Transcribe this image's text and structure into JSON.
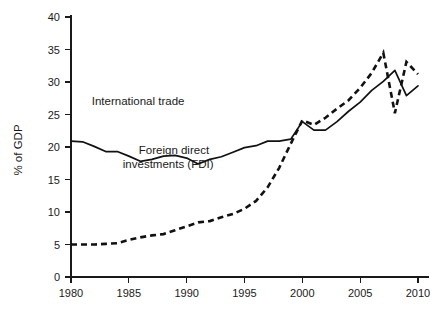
{
  "chart_data": {
    "type": "line",
    "title": "",
    "xlabel": "",
    "ylabel": "% of GDP",
    "xlim": [
      1980,
      2010
    ],
    "ylim": [
      0,
      40
    ],
    "grid": false,
    "legend_position": "inline-annotations",
    "x": [
      1980,
      1981,
      1982,
      1983,
      1984,
      1985,
      1986,
      1987,
      1988,
      1989,
      1990,
      1991,
      1992,
      1993,
      1994,
      1995,
      1996,
      1997,
      1998,
      1999,
      2000,
      2001,
      2002,
      2003,
      2004,
      2005,
      2006,
      2007,
      2008,
      2009,
      2010
    ],
    "xticks": [
      "1980",
      "1985",
      "1990",
      "1995",
      "2000",
      "2005",
      "2010"
    ],
    "xtick_values": [
      1980,
      1985,
      1990,
      1995,
      2000,
      2005,
      2010
    ],
    "yticks": [
      "0",
      "5",
      "10",
      "15",
      "20",
      "25",
      "30",
      "35",
      "40"
    ],
    "ytick_values": [
      0,
      5,
      10,
      15,
      20,
      25,
      30,
      35,
      40
    ],
    "series": [
      {
        "name": "International trade",
        "style": "solid",
        "label_x": 1985.8,
        "label_y": 26.5,
        "values": [
          20.9,
          20.8,
          20.0,
          19.2,
          19.2,
          18.6,
          17.8,
          18.0,
          18.6,
          18.7,
          18.3,
          17.4,
          18.0,
          18.4,
          19.1,
          19.8,
          20.1,
          20.8,
          20.8,
          21.1,
          22.5,
          22.4,
          22.4,
          22.6,
          23.5,
          21.5,
          22.8,
          24.2,
          24.2,
          24.9,
          26.2
        ]
      },
      {
        "name": "Foreign direct investments (FDI)",
        "style": "dashed",
        "label_x": 1988.5,
        "label_y": 18.0,
        "values": [
          5.0,
          5.0,
          5.1,
          5.2,
          5.3,
          5.6,
          5.8,
          6.5,
          7.1,
          7.6,
          8.2,
          8.5,
          8.4,
          9.0,
          9.2,
          9.8,
          10.6,
          12.0,
          14.6,
          19.2,
          23.9,
          22.9,
          23.3,
          24.6,
          25.4,
          27.0,
          29.6,
          32.0,
          30.0,
          30.4,
          30.4
        ]
      }
    ],
    "series_plot": [
      {
        "name": "International trade",
        "style": "solid",
        "points": [
          [
            1980,
            20.9
          ],
          [
            1981,
            20.8
          ],
          [
            1982,
            20.1
          ],
          [
            1983,
            19.3
          ],
          [
            1984,
            19.3
          ],
          [
            1985,
            18.6
          ],
          [
            1986,
            17.8
          ],
          [
            1987,
            18.1
          ],
          [
            1988,
            18.6
          ],
          [
            1989,
            18.7
          ],
          [
            1990,
            18.3
          ],
          [
            1991,
            17.4
          ],
          [
            1992,
            18.1
          ],
          [
            1993,
            18.5
          ],
          [
            1994,
            19.2
          ],
          [
            1995,
            19.9
          ],
          [
            1996,
            20.2
          ],
          [
            1997,
            20.9
          ],
          [
            1998,
            20.9
          ],
          [
            1999,
            21.2
          ],
          [
            2000,
            23.9
          ],
          [
            2001,
            22.6
          ],
          [
            2002,
            22.6
          ],
          [
            2003,
            23.9
          ],
          [
            2004,
            25.5
          ],
          [
            2005,
            26.9
          ],
          [
            2006,
            28.7
          ],
          [
            2007,
            30.1
          ],
          [
            2008,
            31.8
          ],
          [
            2009,
            27.9
          ],
          [
            2010,
            29.4
          ]
        ]
      },
      {
        "name": "Foreign direct investments (FDI)",
        "style": "dashed",
        "points": [
          [
            1980,
            5.0
          ],
          [
            1981,
            5.0
          ],
          [
            1982,
            5.0
          ],
          [
            1983,
            5.1
          ],
          [
            1984,
            5.2
          ],
          [
            1985,
            5.7
          ],
          [
            1986,
            6.1
          ],
          [
            1987,
            6.4
          ],
          [
            1988,
            6.6
          ],
          [
            1989,
            7.2
          ],
          [
            1990,
            7.8
          ],
          [
            1991,
            8.4
          ],
          [
            1992,
            8.6
          ],
          [
            1993,
            9.2
          ],
          [
            1994,
            9.7
          ],
          [
            1995,
            10.5
          ],
          [
            1996,
            11.7
          ],
          [
            1997,
            13.8
          ],
          [
            1998,
            16.8
          ],
          [
            1999,
            20.5
          ],
          [
            2000,
            24.1
          ],
          [
            2001,
            23.4
          ],
          [
            2002,
            24.5
          ],
          [
            2003,
            25.9
          ],
          [
            2004,
            27.2
          ],
          [
            2005,
            29.1
          ],
          [
            2006,
            31.4
          ],
          [
            2007,
            34.5
          ],
          [
            2008,
            25.2
          ],
          [
            2009,
            33.1
          ],
          [
            2010,
            31.2
          ]
        ]
      }
    ],
    "annotations": [
      {
        "text": "International trade",
        "x": 1985.8,
        "y": 26.5
      },
      {
        "text": "Foreign direct",
        "x": 1988.9,
        "y": 19.0
      },
      {
        "text": "investments (FDI)",
        "x": 1988.4,
        "y": 16.7
      }
    ]
  },
  "axes": {
    "y_title": "% of GDP",
    "y_tick_labels": [
      "40",
      "35",
      "30",
      "25",
      "20",
      "15",
      "10",
      "5",
      "0"
    ],
    "x_tick_labels": [
      "1980",
      "1985",
      "1990",
      "1995",
      "2000",
      "2005",
      "2010"
    ]
  }
}
